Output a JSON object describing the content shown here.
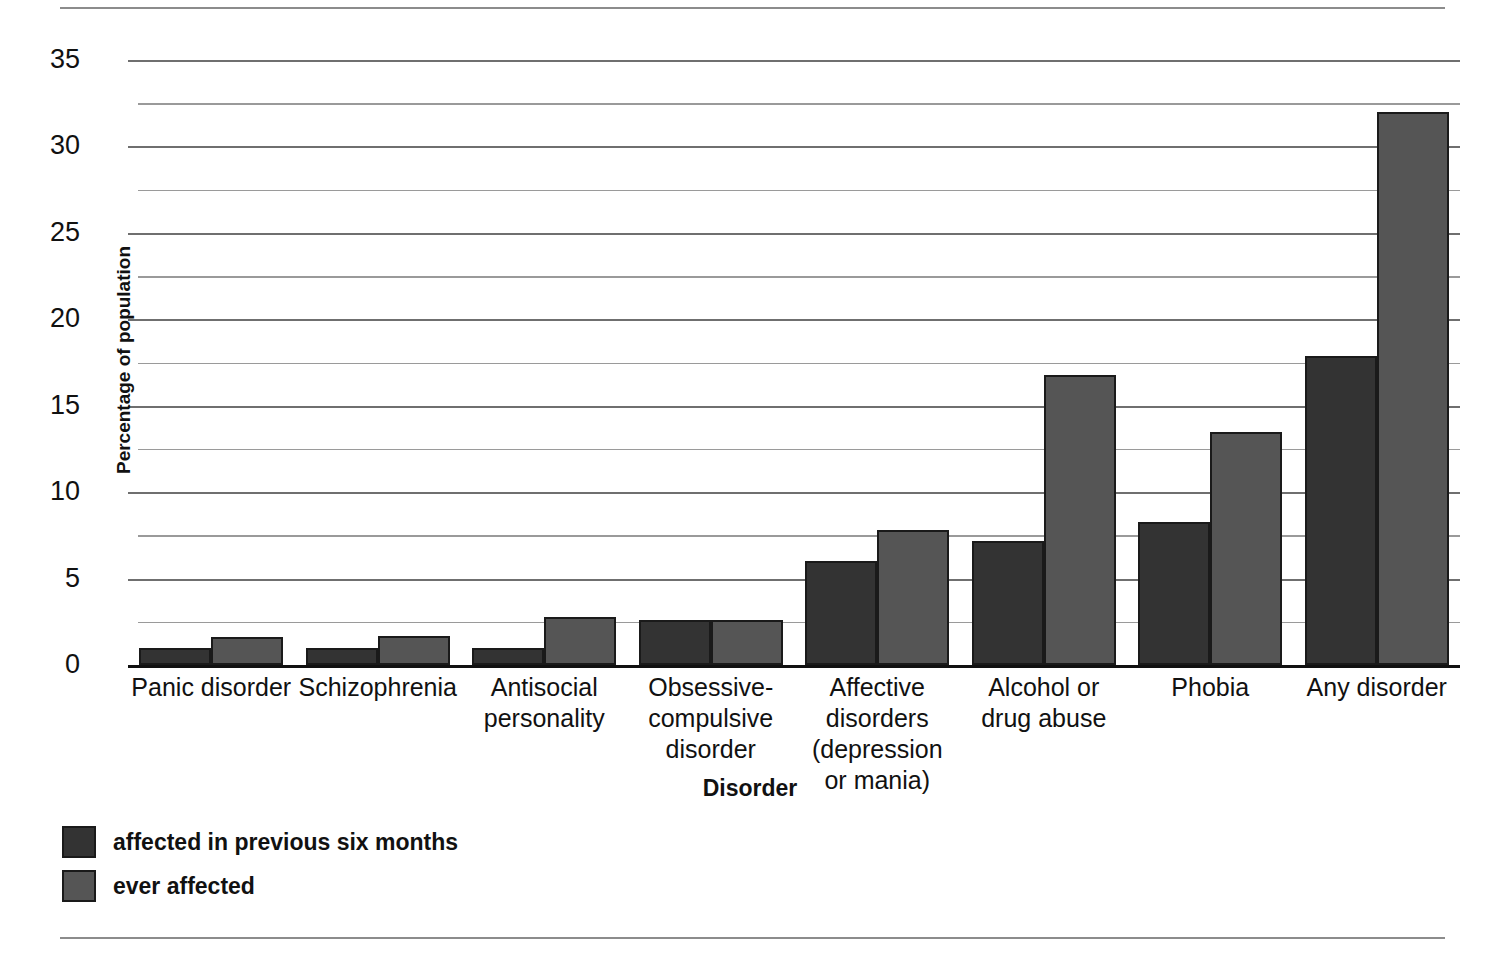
{
  "chart_data": {
    "type": "bar",
    "title": "",
    "xlabel": "Disorder",
    "ylabel": "Percentage of population",
    "ylim": [
      0,
      35
    ],
    "yticks": [
      0,
      5,
      10,
      15,
      20,
      25,
      30,
      35
    ],
    "minor_yticks": [
      2.5,
      7.5,
      12.5,
      17.5,
      22.5,
      27.5,
      32.5
    ],
    "grid": true,
    "legend_position": "below-left",
    "categories": [
      "Panic disorder",
      "Schizophrenia",
      "Antisocial personality",
      "Obsessive-compulsive disorder",
      "Affective disorders (depression or mania)",
      "Alcohol or drug abuse",
      "Phobia",
      "Any disorder"
    ],
    "category_label_lines": [
      [
        "Panic disorder"
      ],
      [
        "Schizophrenia"
      ],
      [
        "Antisocial",
        "personality"
      ],
      [
        "Obsessive-",
        "compulsive",
        "disorder"
      ],
      [
        "Affective",
        "disorders",
        "(depression",
        "or mania)"
      ],
      [
        "Alcohol or",
        "drug abuse"
      ],
      [
        "Phobia"
      ],
      [
        "Any disorder"
      ]
    ],
    "series": [
      {
        "name": "affected in previous six months",
        "color": "#333333",
        "values": [
          1.0,
          1.0,
          1.0,
          2.6,
          6.0,
          7.2,
          8.3,
          17.9
        ]
      },
      {
        "name": "ever affected",
        "color": "#555555",
        "values": [
          1.6,
          1.7,
          2.8,
          2.6,
          7.8,
          16.8,
          13.5,
          32.0
        ]
      }
    ]
  },
  "legend": {
    "items": [
      {
        "label": "affected in previous six months",
        "swatch": "s0"
      },
      {
        "label": "ever affected",
        "swatch": "s1"
      }
    ]
  }
}
